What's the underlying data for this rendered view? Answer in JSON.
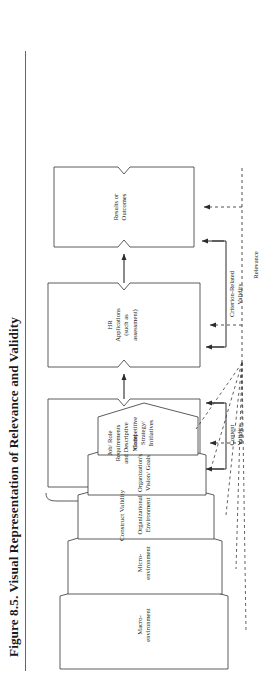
{
  "figure": {
    "title": "Figure 8.5.  Visual Representation of Relevance and Validity",
    "rotation_note": "90"
  },
  "chain": {
    "brace_label": "Construct Validity",
    "boxes": [
      {
        "id": "job-role",
        "lines": [
          "Job/ Role",
          "Requirements",
          "and Descriptive",
          "Model"
        ]
      },
      {
        "id": "hr-applications",
        "lines": [
          "HR",
          "Applications",
          "(such as",
          "assessment)"
        ]
      },
      {
        "id": "results",
        "lines": [
          "Results or",
          "Outcomes"
        ]
      }
    ]
  },
  "environment": {
    "boxes": [
      {
        "id": "macro-environment",
        "lines": [
          "Macro-",
          "environment"
        ]
      },
      {
        "id": "micro-environment",
        "lines": [
          "Micro-",
          "environment"
        ]
      },
      {
        "id": "organizational-environment",
        "lines": [
          "Organizational",
          "Environment"
        ]
      },
      {
        "id": "organizations-vision-goals",
        "lines": [
          "Organization's",
          "Vision/ Goals"
        ]
      },
      {
        "id": "competitive-strategy-initiatives",
        "lines": [
          "Competitive",
          "Strategy/",
          "Initiatives"
        ]
      }
    ]
  },
  "validity": {
    "content": "Content\nValidity",
    "content_line1": "Content",
    "content_line2": "Validity",
    "criterion_line1": "Criterion-Related",
    "criterion_line2": "Validity",
    "relevance": "Relevance"
  },
  "colors": {
    "ink": "#1a1a1a",
    "stroke": "#4a4a4a",
    "rule": "#666666",
    "background": "#ffffff"
  }
}
